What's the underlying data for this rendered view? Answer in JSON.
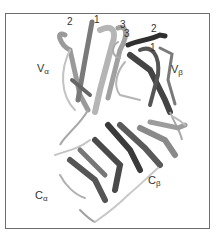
{
  "figure": {
    "domain_labels": {
      "v_alpha": {
        "main": "V",
        "sub": "α"
      },
      "v_beta": {
        "main": "V",
        "sub": "β"
      },
      "c_alpha": {
        "main": "C",
        "sub": "α"
      },
      "c_beta": {
        "main": "C",
        "sub": "β"
      }
    },
    "cdr_labels": {
      "alpha_2": "2",
      "alpha_1": "1",
      "alpha_3": "3",
      "beta_3": "3",
      "beta_2": "2",
      "beta_1": "1"
    },
    "colors": {
      "frame": "#6e6e6e",
      "ribbon_light": "#b8b8b8",
      "ribbon_mid": "#8a8a8a",
      "ribbon_dark": "#3c3c3c",
      "background": "#ffffff"
    }
  }
}
